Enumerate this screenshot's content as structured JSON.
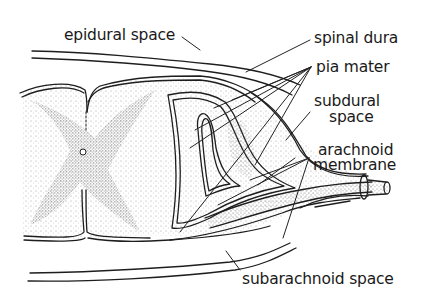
{
  "diagram": {
    "labels": {
      "epidural_space": "epidural space",
      "spinal_dura": "spinal dura",
      "pia_mater": "pia mater",
      "subdural_space_line1": "subdural",
      "subdural_space_line2": "space",
      "arachnoid_membrane_line1": "arachnoid",
      "arachnoid_membrane_line2": "membrane",
      "subarachnoid_space": "subarachnoid space"
    },
    "colors": {
      "ink": "#1e1e1e",
      "background": "#ffffff",
      "stipple_light": "#b8b8b8",
      "stipple_dark": "#6a6a6a"
    }
  }
}
